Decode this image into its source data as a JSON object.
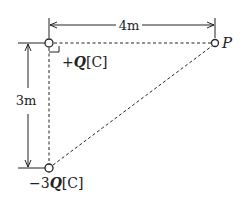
{
  "diagram": {
    "type": "physics-point-charges",
    "horizontal_distance_label": "4m",
    "vertical_distance_label": "3m",
    "charge_top": {
      "label_sign": "+",
      "label_symbol": "Q",
      "label_unit": "[C]"
    },
    "charge_bottom": {
      "label_sign": "−",
      "label_coef": "3",
      "label_symbol": "Q",
      "label_unit": "[C]"
    },
    "point": {
      "label": "P"
    },
    "colors": {
      "line": "#222222",
      "background": "#ffffff"
    }
  }
}
